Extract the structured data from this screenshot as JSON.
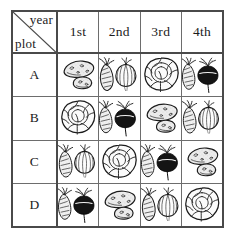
{
  "table": {
    "corner": {
      "column_axis_label": "year",
      "row_axis_label": "plot"
    },
    "column_headers": [
      "1st",
      "2nd",
      "3rd",
      "4th"
    ],
    "row_headers": [
      "A",
      "B",
      "C",
      "D"
    ],
    "rows": [
      {
        "plot": "A",
        "cells": [
          {
            "year": "1st",
            "crop": "potatoes",
            "icon": "potatoes-icon"
          },
          {
            "year": "2nd",
            "crop": "carrot and onion",
            "icon": "carrot-onion-icon"
          },
          {
            "year": "3rd",
            "crop": "cabbage",
            "icon": "cabbage-icon"
          },
          {
            "year": "4th",
            "crop": "carrot and beet",
            "icon": "carrot-beet-icon"
          }
        ]
      },
      {
        "plot": "B",
        "cells": [
          {
            "year": "1st",
            "crop": "cabbage",
            "icon": "cabbage-icon"
          },
          {
            "year": "2nd",
            "crop": "carrot and beet",
            "icon": "carrot-beet-icon"
          },
          {
            "year": "3rd",
            "crop": "potatoes",
            "icon": "potatoes-icon"
          },
          {
            "year": "4th",
            "crop": "carrot and onion",
            "icon": "carrot-onion-icon"
          }
        ]
      },
      {
        "plot": "C",
        "cells": [
          {
            "year": "1st",
            "crop": "carrot and onion",
            "icon": "carrot-onion-icon"
          },
          {
            "year": "2nd",
            "crop": "cabbage",
            "icon": "cabbage-icon"
          },
          {
            "year": "3rd",
            "crop": "carrot and beet",
            "icon": "carrot-beet-icon"
          },
          {
            "year": "4th",
            "crop": "potatoes",
            "icon": "potatoes-icon"
          }
        ]
      },
      {
        "plot": "D",
        "cells": [
          {
            "year": "1st",
            "crop": "carrot and beet",
            "icon": "carrot-beet-icon"
          },
          {
            "year": "2nd",
            "crop": "potatoes",
            "icon": "potatoes-icon"
          },
          {
            "year": "3rd",
            "crop": "carrot and onion",
            "icon": "carrot-onion-icon"
          },
          {
            "year": "4th",
            "crop": "cabbage",
            "icon": "cabbage-icon"
          }
        ]
      }
    ]
  },
  "colors": {
    "ink": "#1b1b1b",
    "grid": "#6d6d6d",
    "grid_outer": "#4a4a4a",
    "paper": "#ffffff",
    "fill_light": "#ededed",
    "beet_dark": "#141414"
  }
}
